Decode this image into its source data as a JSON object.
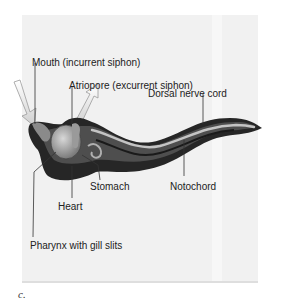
{
  "figure": {
    "panel_label": "c."
  },
  "labels": {
    "mouth": "Mouth (incurrent siphon)",
    "atriopore": "Atriopore (excurrent siphon)",
    "dorsal_nerve_cord": "Dorsal nerve cord",
    "stomach": "Stomach",
    "notochord": "Notochord",
    "heart": "Heart",
    "pharynx": "Pharynx with gill slits"
  },
  "colors": {
    "background": "#ffffff",
    "panel": "#f1f1f1",
    "body_dark": "#2a2a2a",
    "body_mid": "#5a5a5a",
    "nerve_cord": "#bdbdbd",
    "leader_line": "#333333"
  }
}
